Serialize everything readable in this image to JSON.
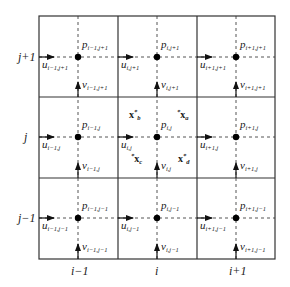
{
  "diagram": {
    "type": "staggered-grid",
    "colors": {
      "grid_line": "#333333",
      "dashed_line": "#555555",
      "node": "#000000",
      "text": "#1a1a1a"
    },
    "row_labels": [
      {
        "id": "row-j-plus-1",
        "text": "j+1"
      },
      {
        "id": "row-j",
        "text": "j"
      },
      {
        "id": "row-j-minus-1",
        "text": "j−1"
      }
    ],
    "column_labels": [
      {
        "id": "col-i-minus-1",
        "text": "i−1"
      },
      {
        "id": "col-i",
        "text": "i"
      },
      {
        "id": "col-i-plus-1",
        "text": "i+1"
      }
    ],
    "cells": [
      [
        {
          "p": "p",
          "p_sub": "i−1,j+1",
          "u": "u",
          "u_sub": "i−1,j+1",
          "v": "v",
          "v_sub": "i−1,j+1"
        },
        {
          "p": "p",
          "p_sub": "i,j+1",
          "u": "u",
          "u_sub": "i,j+1",
          "v": "v",
          "v_sub": "i,j+1"
        },
        {
          "p": "p",
          "p_sub": "i+1,j+1",
          "u": "u",
          "u_sub": "i+1,j+1",
          "v": "v",
          "v_sub": "i+1,j+1"
        }
      ],
      [
        {
          "p": "p",
          "p_sub": "i−1,j",
          "u": "u",
          "u_sub": "i−1,j",
          "v": "v",
          "v_sub": "i−1,j"
        },
        {
          "p": "p",
          "p_sub": "i,j",
          "u": "u",
          "u_sub": "i,j",
          "v": "v",
          "v_sub": "i,j"
        },
        {
          "p": "p",
          "p_sub": "i+1,j",
          "u": "u",
          "u_sub": "i+1,j",
          "v": "v",
          "v_sub": "i+1,j"
        }
      ],
      [
        {
          "p": "p",
          "p_sub": "i−1,j−1",
          "u": "u",
          "u_sub": "i−1,j−1",
          "v": "v",
          "v_sub": "i−1,j−1"
        },
        {
          "p": "p",
          "p_sub": "i,j−1",
          "u": "u",
          "u_sub": "i,j−1",
          "v": "v",
          "v_sub": "i,j−1"
        },
        {
          "p": "p",
          "p_sub": "i+1,j−1",
          "u": "u",
          "u_sub": "i+1,j−1",
          "v": "v",
          "v_sub": "i+1,j−1"
        }
      ]
    ],
    "corner_points": {
      "a": {
        "base": "x",
        "sup": "*",
        "sub": "a"
      },
      "b": {
        "base": "x",
        "sup": "*",
        "sub": "b"
      },
      "c": {
        "base": "x",
        "sup": "*",
        "sub": "c"
      },
      "d": {
        "base": "x",
        "sup": "*",
        "sub": "d"
      }
    }
  }
}
